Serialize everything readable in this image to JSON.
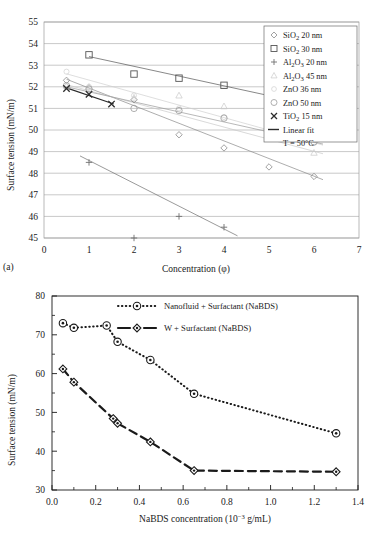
{
  "figure": {
    "panel_a_label": "(a)",
    "panel_b_label": "(b)"
  },
  "chart_data": [
    {
      "id": "panel-a",
      "type": "scatter",
      "title": "",
      "xlabel": "Concentration (φ)",
      "ylabel": "Surface tension (mN/m)",
      "xlim": [
        0,
        7
      ],
      "ylim": [
        45,
        55
      ],
      "xticks": [
        "0",
        "1",
        "2",
        "3",
        "4",
        "5",
        "6",
        "7"
      ],
      "yticks": [
        "45",
        "46",
        "47",
        "48",
        "49",
        "50",
        "51",
        "52",
        "53",
        "54",
        "55"
      ],
      "grid": "horizontal",
      "legend_position": "top-right",
      "annotation": "T = 50°C",
      "series": [
        {
          "name": "SiO2 20 nm",
          "label_parts": {
            "pre": "SiO",
            "sub": "2",
            "post": " 20 nm"
          },
          "marker": "diamond",
          "color": "#8a8a8a",
          "x": [
            0.5,
            2.0,
            3.0,
            4.0,
            5.0,
            6.0
          ],
          "y": [
            52.3,
            51.4,
            49.78,
            49.17,
            48.29,
            47.85
          ],
          "fit": {
            "x": [
              0.5,
              6.2
            ],
            "y": [
              52.35,
              47.7
            ]
          }
        },
        {
          "name": "SiO2 30 nm",
          "label_parts": {
            "pre": "SiO",
            "sub": "2",
            "post": " 30 nm"
          },
          "marker": "square",
          "color": "#555555",
          "x": [
            1.0,
            2.0,
            3.0,
            4.0,
            5.0
          ],
          "y": [
            53.48,
            52.59,
            52.4,
            52.07,
            51.57
          ],
          "fit": {
            "x": [
              1.0,
              5.2
            ],
            "y": [
              53.4,
              51.5
            ]
          }
        },
        {
          "name": "Al2O3 20 nm",
          "label_parts": {
            "pre": "Al",
            "sub": "2",
            "mid": "O",
            "sub2": "3",
            "post": " 20 nm"
          },
          "marker": "plus",
          "color": "#6f6f6f",
          "x": [
            1.0,
            2.0,
            3.0,
            4.0
          ],
          "y": [
            48.5,
            45.0,
            46.0,
            45.5
          ],
          "fit": {
            "x": [
              0.8,
              4.3
            ],
            "y": [
              48.8,
              45.1
            ]
          }
        },
        {
          "name": "Al2O3 45 nm",
          "label_parts": {
            "pre": "Al",
            "sub": "2",
            "mid": "O",
            "sub2": "3",
            "post": " 45 nm"
          },
          "marker": "triangle",
          "color": "#c8c8c8",
          "x": [
            0.5,
            1.0,
            2.0,
            3.0,
            4.0,
            5.0,
            6.0
          ],
          "y": [
            52.05,
            52.0,
            51.5,
            51.6,
            51.1,
            49.8,
            48.95
          ],
          "fit": {
            "x": [
              0.5,
              6.2
            ],
            "y": [
              52.1,
              48.9
            ]
          }
        },
        {
          "name": "ZnO 36 nm",
          "label_parts": {
            "pre": "ZnO",
            "post": " 36 nm"
          },
          "marker": "dot",
          "color": "#d0d0d0",
          "x": [
            0.5,
            1.0,
            2.0,
            3.0,
            4.0,
            5.0,
            6.0
          ],
          "y": [
            52.7,
            52.0,
            51.6,
            51.0,
            50.6,
            50.0,
            49.4
          ],
          "fit": {
            "x": [
              0.5,
              6.2
            ],
            "y": [
              52.6,
              49.3
            ]
          }
        },
        {
          "name": "ZnO 50 nm",
          "label_parts": {
            "pre": "ZnO",
            "post": " 50 nm"
          },
          "marker": "circle",
          "color": "#9a9a9a",
          "x": [
            0.5,
            1.0,
            2.0,
            3.0,
            4.0,
            5.0,
            6.0
          ],
          "y": [
            52.05,
            51.9,
            51.0,
            50.9,
            50.55,
            50.03,
            49.45
          ],
          "fit": {
            "x": [
              0.5,
              6.2
            ],
            "y": [
              52.0,
              49.35
            ]
          }
        },
        {
          "name": "TiO2 15 nm",
          "label_parts": {
            "pre": "TiO",
            "sub": "2",
            "post": " 15 nm"
          },
          "marker": "x",
          "color": "#2b2b2b",
          "x": [
            0.5,
            1.0,
            1.5
          ],
          "y": [
            51.92,
            51.65,
            51.2
          ],
          "fit": {
            "x": [
              0.5,
              1.55
            ],
            "y": [
              51.95,
              51.2
            ]
          }
        }
      ],
      "legend_extra": [
        {
          "label": "Linear fit",
          "marker": "line"
        },
        {
          "label": "T = 50°C",
          "marker": "none"
        }
      ]
    },
    {
      "id": "panel-b",
      "type": "line",
      "title": "",
      "xlabel": "NaBDS concentration (10⁻³ g/mL)",
      "xlabel_parts": {
        "pre": "NaBDS concentration (10",
        "sup": "−3",
        "post": " g/mL)"
      },
      "ylabel": "Surface tension (mN/m)",
      "xlim": [
        0.0,
        1.4
      ],
      "ylim": [
        30,
        80
      ],
      "xticks": [
        "0.0",
        "0.2",
        "0.4",
        "0.6",
        "0.8",
        "1.0",
        "1.2",
        "1.4"
      ],
      "yticks": [
        "30",
        "40",
        "50",
        "60",
        "70",
        "80"
      ],
      "grid": "none",
      "legend_position": "top-center",
      "series": [
        {
          "name": "Nanofluid + Surfactant (NaBDS)",
          "marker": "circle-dot",
          "linestyle": "dotted",
          "color": "#1a1a1a",
          "x": [
            0.05,
            0.1,
            0.25,
            0.3,
            0.45,
            0.65,
            1.3
          ],
          "y": [
            73.0,
            71.8,
            72.4,
            68.2,
            63.5,
            54.8,
            44.6
          ]
        },
        {
          "name": "W + Surfactant (NaBDS)",
          "marker": "diamond-dot",
          "linestyle": "dashed",
          "color": "#1a1a1a",
          "x": [
            0.05,
            0.1,
            0.28,
            0.3,
            0.45,
            0.65,
            1.3
          ],
          "y": [
            61.2,
            57.8,
            48.4,
            47.2,
            42.4,
            35.0,
            34.7
          ]
        }
      ]
    }
  ]
}
